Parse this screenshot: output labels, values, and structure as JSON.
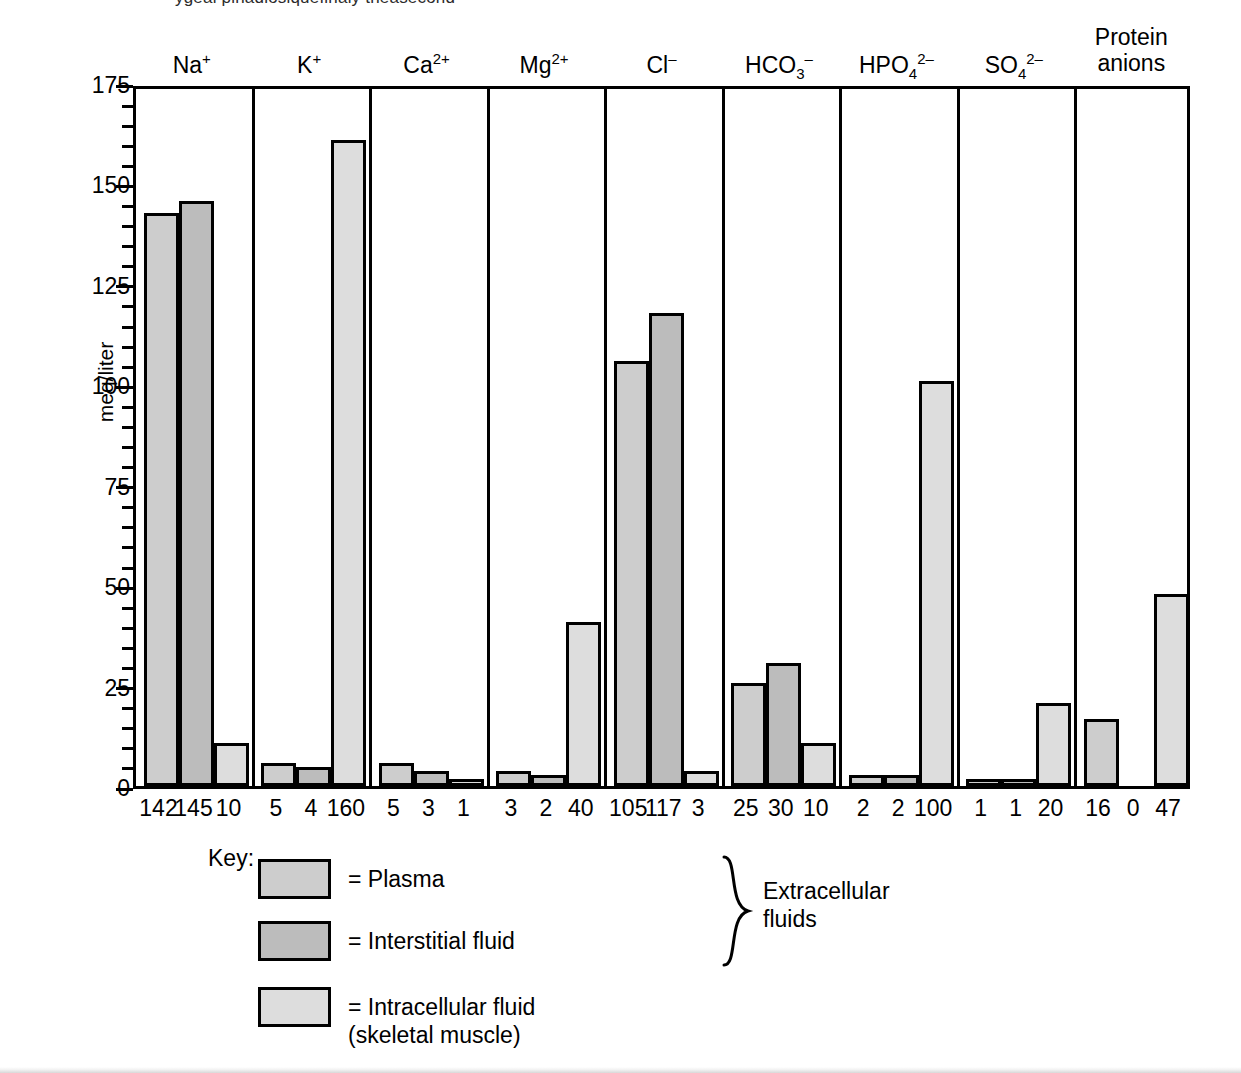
{
  "figure": {
    "top_crop_text": "ygeal pinadlosiquefinaly theasecond",
    "y_axis_label": "meq/liter",
    "y_ticks": [
      0,
      25,
      50,
      75,
      100,
      125,
      150,
      175
    ],
    "y_minor_step": 5,
    "ylim": [
      0,
      175
    ]
  },
  "legend": {
    "title": "Key:",
    "rows": [
      {
        "swatch": "plasma",
        "text": "= Plasma"
      },
      {
        "swatch": "interstitial",
        "text": "= Interstitial fluid"
      },
      {
        "swatch": "intracellular",
        "text": "= Intracellular fluid\n(skeletal muscle)"
      }
    ],
    "brace_label": "Extracellular\nfluids"
  },
  "chart_data": {
    "type": "bar",
    "title": "",
    "xlabel": "",
    "ylabel": "meq/liter",
    "ylim": [
      0,
      175
    ],
    "grid": false,
    "legend_position": "below-left",
    "categories": [
      "Na+",
      "K+",
      "Ca2+",
      "Mg2+",
      "Cl-",
      "HCO3-",
      "HPO4 2-",
      "SO4 2-",
      "Protein anions"
    ],
    "category_labels_html": [
      {
        "base": "Na",
        "sup": "+",
        "sub": "",
        "line2": ""
      },
      {
        "base": "K",
        "sup": "+",
        "sub": "",
        "line2": ""
      },
      {
        "base": "Ca",
        "sup": "2+",
        "sub": "",
        "line2": ""
      },
      {
        "base": "Mg",
        "sup": "2+",
        "sub": "",
        "line2": ""
      },
      {
        "base": "Cl",
        "sup": "–",
        "sub": "",
        "line2": ""
      },
      {
        "base": "HCO",
        "sup": "–",
        "sub": "3",
        "line2": ""
      },
      {
        "base": "HPO",
        "sup": "2–",
        "sub": "4",
        "line2": ""
      },
      {
        "base": "SO",
        "sup": "2–",
        "sub": "4",
        "line2": ""
      },
      {
        "base": "Protein",
        "sup": "",
        "sub": "",
        "line2": "anions"
      }
    ],
    "series": [
      {
        "name": "Plasma",
        "key": "plasma",
        "color": "#cdcdcd",
        "values": [
          142,
          5,
          5,
          3,
          105,
          25,
          2,
          1,
          16
        ]
      },
      {
        "name": "Interstitial fluid",
        "key": "interstitial",
        "color": "#bcbcbc",
        "values": [
          145,
          4,
          3,
          2,
          117,
          30,
          2,
          1,
          0
        ]
      },
      {
        "name": "Intracellular fluid (skeletal muscle)",
        "key": "intracellular",
        "color": "#dddddd",
        "values": [
          10,
          160,
          1,
          40,
          3,
          10,
          100,
          20,
          47
        ]
      }
    ],
    "value_labels": [
      [
        "142",
        "145",
        "10"
      ],
      [
        "5",
        "4",
        "160"
      ],
      [
        "5",
        "3",
        "1"
      ],
      [
        "3",
        "2",
        "40"
      ],
      [
        "105",
        "117",
        "3"
      ],
      [
        "25",
        "30",
        "10"
      ],
      [
        "2",
        "2",
        "100"
      ],
      [
        "1",
        "1",
        "20"
      ],
      [
        "16",
        "0",
        "47"
      ]
    ]
  }
}
